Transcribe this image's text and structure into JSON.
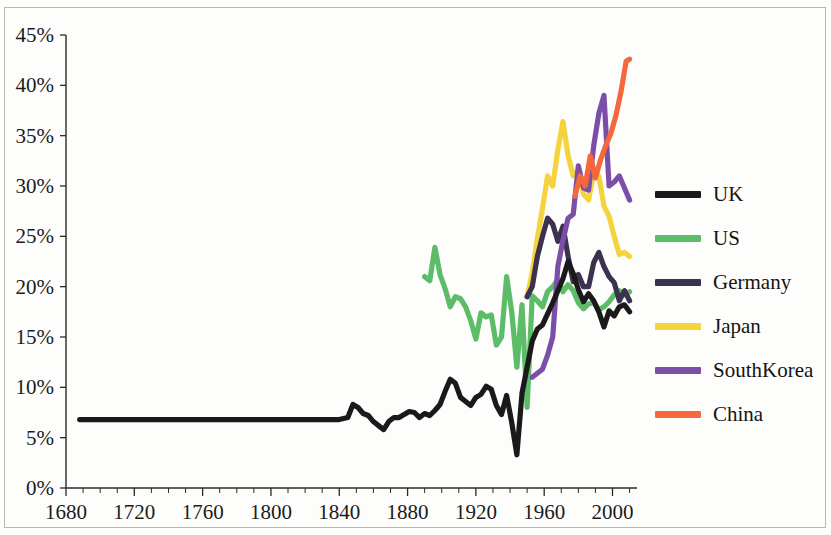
{
  "chart_data": {
    "type": "line",
    "title": "",
    "subtitle": "",
    "xlabel": "",
    "ylabel": "",
    "xlim": [
      1680,
      2012
    ],
    "ylim": [
      0,
      45
    ],
    "grid": false,
    "legend_position": "right",
    "y_tick_labels": [
      "0%",
      "5%",
      "10%",
      "15%",
      "20%",
      "25%",
      "30%",
      "35%",
      "40%",
      "45%"
    ],
    "y_tick_values": [
      0,
      5,
      10,
      15,
      20,
      25,
      30,
      35,
      40,
      45
    ],
    "x_tick_labels": [
      "1680",
      "1720",
      "1760",
      "1800",
      "1840",
      "1880",
      "1920",
      "1960",
      "2000"
    ],
    "x_tick_values": [
      1680,
      1720,
      1760,
      1800,
      1840,
      1880,
      1920,
      1960,
      2000
    ],
    "x_minor_step": 10,
    "y_unit": "percent",
    "series": [
      {
        "name": "UK",
        "color": "#1a1a1a",
        "x": [
          1688,
          1700,
          1720,
          1740,
          1760,
          1780,
          1800,
          1820,
          1840,
          1845,
          1848,
          1851,
          1854,
          1857,
          1860,
          1863,
          1866,
          1869,
          1872,
          1875,
          1878,
          1881,
          1884,
          1887,
          1890,
          1893,
          1896,
          1899,
          1902,
          1905,
          1908,
          1911,
          1914,
          1917,
          1920,
          1923,
          1926,
          1929,
          1932,
          1935,
          1938,
          1941,
          1944,
          1947,
          1950,
          1953,
          1956,
          1959,
          1962,
          1965,
          1968,
          1971,
          1974,
          1977,
          1980,
          1983,
          1986,
          1989,
          1992,
          1995,
          1998,
          2001,
          2004,
          2007,
          2010
        ],
        "values": [
          6.8,
          6.8,
          6.8,
          6.8,
          6.8,
          6.8,
          6.8,
          6.8,
          6.8,
          7.0,
          8.3,
          8.0,
          7.4,
          7.2,
          6.6,
          6.2,
          5.8,
          6.6,
          7.0,
          7.0,
          7.3,
          7.6,
          7.5,
          7.0,
          7.4,
          7.2,
          7.7,
          8.3,
          9.6,
          10.8,
          10.4,
          9.0,
          8.6,
          8.2,
          9.0,
          9.3,
          10.1,
          9.8,
          8.2,
          7.3,
          9.2,
          6.5,
          3.3,
          9.4,
          12.0,
          14.6,
          15.8,
          16.2,
          17.3,
          18.4,
          19.6,
          20.8,
          22.5,
          21.3,
          19.7,
          18.5,
          19.3,
          18.6,
          17.5,
          16.0,
          17.6,
          17.1,
          18.0,
          18.2,
          17.5
        ]
      },
      {
        "name": "US",
        "color": "#5cbc67",
        "x": [
          1890,
          1893,
          1896,
          1899,
          1902,
          1905,
          1908,
          1911,
          1914,
          1917,
          1920,
          1923,
          1926,
          1929,
          1932,
          1935,
          1938,
          1941,
          1944,
          1947,
          1950,
          1953,
          1956,
          1959,
          1962,
          1965,
          1968,
          1971,
          1974,
          1977,
          1980,
          1983,
          1986,
          1989,
          1992,
          1995,
          1998,
          2001,
          2004,
          2007,
          2010
        ],
        "values": [
          21.0,
          20.6,
          23.9,
          21.2,
          19.8,
          18.0,
          19.0,
          18.8,
          18.0,
          16.6,
          14.8,
          17.4,
          17.0,
          17.2,
          14.2,
          15.0,
          21.0,
          17.5,
          12.0,
          18.2,
          8.0,
          19.1,
          18.6,
          18.0,
          19.5,
          20.0,
          20.7,
          19.5,
          20.2,
          19.6,
          18.4,
          17.8,
          18.3,
          18.4,
          17.7,
          18.0,
          18.5,
          19.2,
          19.6,
          19.2,
          19.5
        ]
      },
      {
        "name": "Germany",
        "color": "#3b3250",
        "x": [
          1950,
          1953,
          1956,
          1959,
          1962,
          1965,
          1968,
          1971,
          1974,
          1977,
          1980,
          1983,
          1986,
          1989,
          1992,
          1995,
          1998,
          2001,
          2004,
          2007,
          2010
        ],
        "values": [
          19.0,
          20.0,
          23.0,
          25.0,
          26.8,
          26.2,
          24.5,
          26.0,
          23.0,
          20.5,
          21.2,
          20.0,
          20.0,
          22.4,
          23.4,
          22.0,
          21.0,
          20.4,
          18.6,
          19.6,
          18.6
        ]
      },
      {
        "name": "Japan",
        "color": "#f5d33c",
        "x": [
          1950,
          1953,
          1956,
          1959,
          1962,
          1965,
          1968,
          1971,
          1974,
          1977,
          1980,
          1983,
          1986,
          1989,
          1992,
          1995,
          1998,
          2001,
          2004,
          2007,
          2010
        ],
        "values": [
          19.0,
          21.4,
          24.8,
          27.8,
          31.0,
          30.0,
          33.6,
          36.4,
          33.0,
          31.0,
          31.6,
          29.2,
          28.6,
          31.4,
          31.0,
          28.0,
          27.0,
          25.0,
          23.2,
          23.4,
          23.0
        ]
      },
      {
        "name": "SouthKorea",
        "color": "#7b4fa8",
        "x": [
          1953,
          1956,
          1959,
          1962,
          1965,
          1968,
          1971,
          1974,
          1977,
          1980,
          1983,
          1986,
          1989,
          1992,
          1995,
          1998,
          2001,
          2004,
          2007,
          2010
        ],
        "values": [
          11.0,
          11.4,
          11.8,
          13.2,
          15.0,
          22.0,
          24.6,
          26.8,
          27.2,
          32.0,
          29.8,
          29.6,
          34.0,
          37.2,
          39.0,
          30.0,
          30.4,
          31.0,
          29.8,
          28.6
        ]
      },
      {
        "name": "China",
        "color": "#f4683c",
        "x": [
          1978,
          1981,
          1984,
          1987,
          1990,
          1993,
          1996,
          1999,
          2002,
          2005,
          2008,
          2010
        ],
        "values": [
          29.0,
          31.0,
          30.0,
          33.0,
          30.8,
          32.6,
          34.0,
          35.2,
          37.0,
          39.4,
          42.4,
          42.6
        ]
      }
    ]
  },
  "legend": {
    "entries": [
      {
        "label": "UK",
        "color": "#1a1a1a"
      },
      {
        "label": "US",
        "color": "#5cbc67"
      },
      {
        "label": "Germany",
        "color": "#3b3250"
      },
      {
        "label": "Japan",
        "color": "#f5d33c"
      },
      {
        "label": "SouthKorea",
        "color": "#7b4fa8"
      },
      {
        "label": "China",
        "color": "#f4683c"
      }
    ]
  }
}
